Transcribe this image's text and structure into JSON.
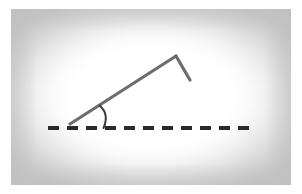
{
  "figure": {
    "canvas": {
      "width": 302,
      "height": 194
    },
    "background_color": "#ffffff",
    "frame": {
      "name": "vignette-frame",
      "left": 11,
      "top": 9,
      "width": 280,
      "height": 176,
      "edge_color": "#c6c6c6",
      "center_color": "#ffffff"
    },
    "baseline": {
      "label": "horizontal dashed baseline",
      "color": "#2a2a2a",
      "stroke_width": 4,
      "y": 128,
      "x_start": 48,
      "x_end": 253,
      "dash_length": 11,
      "gap_length": 8
    },
    "ray": {
      "label": "inclined ray",
      "color": "#6d6d6d",
      "stroke_width": 3.2,
      "x1": 70,
      "y1": 124,
      "x2": 176,
      "y2": 56
    },
    "short_segment": {
      "label": "short descending segment",
      "color": "#6d6d6d",
      "stroke_width": 3.2,
      "x1": 176,
      "y1": 56,
      "x2": 190,
      "y2": 80
    },
    "vertex": {
      "label": "ray origin vertex",
      "x": 70,
      "y": 124
    },
    "apex": {
      "label": "apex bend point",
      "x": 176,
      "y": 56
    },
    "angle_arc": {
      "label": "angle arc marker",
      "color": "#3a3a3a",
      "stroke_width": 2,
      "center_x": 70,
      "center_y": 126,
      "radius": 36,
      "path": "M 99.5 105.5 C 106 111 107.5 119 103.5 128"
    }
  }
}
